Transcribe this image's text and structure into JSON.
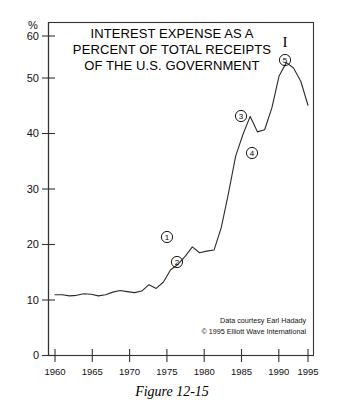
{
  "figure": {
    "caption": "Figure 12-15"
  },
  "chart_data": {
    "type": "line",
    "title_lines": [
      "INTEREST EXPENSE AS A",
      "PERCENT OF TOTAL RECEIPTS",
      "OF THE U.S. GOVERNMENT"
    ],
    "xlabel": "",
    "ylabel": "%",
    "yunit": "%",
    "xlim": [
      1960,
      1996
    ],
    "ylim": [
      0,
      60
    ],
    "yticks": [
      0,
      10,
      20,
      30,
      40,
      50,
      60
    ],
    "ytick_labels": [
      "0",
      "10",
      "20",
      "30",
      "40",
      "50",
      "60"
    ],
    "xticks": [
      1960,
      1965,
      1970,
      1975,
      1980,
      1985,
      1990,
      1995
    ],
    "xtick_labels": [
      "1960",
      "1965",
      "1970",
      "1975",
      "1980",
      "1985",
      "1990",
      "1995"
    ],
    "grid": false,
    "legend": null,
    "series": [
      {
        "name": "Interest expense as percent of total receipts",
        "x": [
          1960,
          1961,
          1962,
          1963,
          1964,
          1965,
          1966,
          1967,
          1968,
          1969,
          1970,
          1971,
          1972,
          1973,
          1974,
          1975,
          1976,
          1977,
          1978,
          1979,
          1980,
          1981,
          1982,
          1983,
          1984,
          1985,
          1986,
          1987,
          1988,
          1989,
          1990,
          1991,
          1992,
          1993,
          1994,
          1995
        ],
        "values": [
          11.4,
          11.4,
          11.2,
          11.3,
          11.6,
          11.5,
          11.2,
          11.4,
          11.9,
          12.2,
          12.0,
          11.8,
          12.1,
          13.3,
          12.6,
          13.8,
          16.1,
          17.1,
          18.6,
          20.4,
          19.3,
          19.6,
          19.8,
          24.0,
          30.5,
          37.5,
          41.5,
          44.9,
          42.0,
          42.4,
          46.5,
          52.5,
          55.0,
          54.0,
          51.5,
          47.0
        ]
      }
    ],
    "annotations": [
      {
        "label": "1",
        "x": 1979,
        "y": 20.4,
        "position": "above",
        "style": "circled"
      },
      {
        "label": "2",
        "x": 1981,
        "y": 19.6,
        "position": "below",
        "style": "circled"
      },
      {
        "label": "3",
        "x": 1987,
        "y": 44.9,
        "position": "above",
        "style": "circled"
      },
      {
        "label": "4",
        "x": 1989,
        "y": 42.4,
        "position": "below",
        "style": "circled"
      },
      {
        "label": "5",
        "x": 1992,
        "y": 55.0,
        "position": "above",
        "style": "circled"
      }
    ],
    "degree_marks": [
      {
        "symbol": "I",
        "x": 1992,
        "note": "primary degree mark above wave 5"
      }
    ],
    "credits": [
      "Data courtesy Earl Hadady",
      "© 1995 Elliott Wave International"
    ]
  }
}
